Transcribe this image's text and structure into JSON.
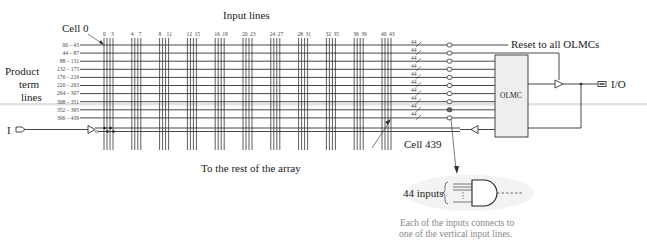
{
  "labels": {
    "input_lines": "Input lines",
    "cell_0": "Cell 0",
    "cell_439": "Cell 439",
    "product_term_lines": [
      "Product",
      "term",
      "lines"
    ],
    "input_pin": "I",
    "reset": "Reset to all OLMCs",
    "olmc": "OLMC",
    "io_pin": "I/O",
    "rest_of_array": "To the rest of the array",
    "and_inputs": "44 inputs",
    "caption_line1": "Each of the inputs connects to",
    "caption_line2": "one of the vertical input lines."
  },
  "column_groups": [
    {
      "start": "0",
      "end": "3"
    },
    {
      "start": "4",
      "end": "7"
    },
    {
      "start": "8",
      "end": "11"
    },
    {
      "start": "12",
      "end": "15"
    },
    {
      "start": "16",
      "end": "19"
    },
    {
      "start": "20",
      "end": "23"
    },
    {
      "start": "24",
      "end": "27"
    },
    {
      "start": "28",
      "end": "31"
    },
    {
      "start": "32",
      "end": "35"
    },
    {
      "start": "36",
      "end": "39"
    },
    {
      "start": "40",
      "end": "43"
    }
  ],
  "product_term_rows": [
    {
      "range": "00 – 43",
      "bus_width": "44"
    },
    {
      "range": "44 – 87",
      "bus_width": "44"
    },
    {
      "range": "88 – 131",
      "bus_width": "44"
    },
    {
      "range": "132 – 175",
      "bus_width": "44"
    },
    {
      "range": "176 – 219",
      "bus_width": "44"
    },
    {
      "range": "220 – 263",
      "bus_width": "44"
    },
    {
      "range": "264 – 307",
      "bus_width": "44"
    },
    {
      "range": "308 – 351",
      "bus_width": "44"
    },
    {
      "range": "352 – 395",
      "bus_width": "44"
    },
    {
      "range": "396 – 439",
      "bus_width": "44"
    }
  ],
  "colors": {
    "line": "#333333",
    "caption": "#888888",
    "olmc_fill": "#eeeeee"
  }
}
